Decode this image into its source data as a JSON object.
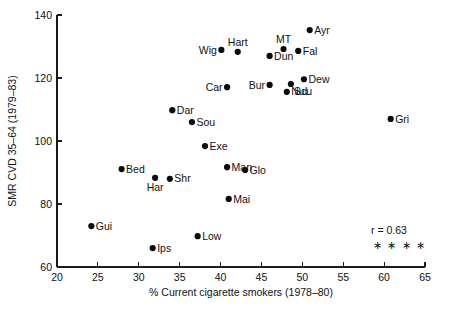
{
  "chart_data": {
    "type": "scatter",
    "title": "",
    "xlabel": "% Current cigarette smokers (1978–80)",
    "ylabel": "SMR CVD 35–64 (1979–83)",
    "xlim": [
      20,
      65
    ],
    "ylim": [
      60,
      140
    ],
    "xticks": [
      20,
      25,
      30,
      35,
      40,
      45,
      50,
      55,
      60,
      65
    ],
    "yticks": [
      60,
      80,
      100,
      120,
      140
    ],
    "xtick_labels": [
      "20",
      "25",
      "30",
      "35",
      "40",
      "45",
      "50",
      "55",
      "60",
      "65"
    ],
    "ytick_labels": [
      "60",
      "80",
      "100",
      "120",
      "140"
    ],
    "grid": false,
    "legend": "none",
    "points": [
      {
        "label": "Ayr",
        "x": 50.9,
        "y": 135.2,
        "label_pos": "right"
      },
      {
        "label": "Wig",
        "x": 40.1,
        "y": 128.9,
        "label_pos": "left"
      },
      {
        "label": "Hart",
        "x": 42.1,
        "y": 128.3,
        "label_pos": "above"
      },
      {
        "label": "MT",
        "x": 47.7,
        "y": 129.2,
        "label_pos": "above"
      },
      {
        "label": "Fal",
        "x": 49.5,
        "y": 128.6,
        "label_pos": "right"
      },
      {
        "label": "Dun",
        "x": 46.0,
        "y": 127.0,
        "label_pos": "right"
      },
      {
        "label": "Dew",
        "x": 50.2,
        "y": 119.6,
        "label_pos": "right"
      },
      {
        "label": "Scu",
        "x": 48.6,
        "y": 118.1,
        "label_pos": "below-right"
      },
      {
        "label": "Bur",
        "x": 46.0,
        "y": 117.8,
        "label_pos": "left"
      },
      {
        "label": "Car",
        "x": 40.8,
        "y": 117.1,
        "label_pos": "left"
      },
      {
        "label": "NuL",
        "x": 48.1,
        "y": 115.6,
        "label_pos": "right"
      },
      {
        "label": "Gri",
        "x": 60.8,
        "y": 107.0,
        "label_pos": "right"
      },
      {
        "label": "Dar",
        "x": 34.1,
        "y": 109.8,
        "label_pos": "right"
      },
      {
        "label": "Sou",
        "x": 36.5,
        "y": 106.0,
        "label_pos": "right"
      },
      {
        "label": "Exe",
        "x": 38.1,
        "y": 98.4,
        "label_pos": "right"
      },
      {
        "label": "Bed",
        "x": 27.9,
        "y": 91.1,
        "label_pos": "right"
      },
      {
        "label": "Man",
        "x": 40.8,
        "y": 91.7,
        "label_pos": "right"
      },
      {
        "label": "Glo",
        "x": 43.0,
        "y": 90.8,
        "label_pos": "right"
      },
      {
        "label": "Har",
        "x": 32.0,
        "y": 88.3,
        "label_pos": "below"
      },
      {
        "label": "Shr",
        "x": 33.8,
        "y": 88.0,
        "label_pos": "right"
      },
      {
        "label": "Mai",
        "x": 41.0,
        "y": 81.6,
        "label_pos": "right"
      },
      {
        "label": "Gui",
        "x": 24.2,
        "y": 73.0,
        "label_pos": "right"
      },
      {
        "label": "Low",
        "x": 37.2,
        "y": 69.8,
        "label_pos": "right"
      },
      {
        "label": "Ips",
        "x": 31.7,
        "y": 66.0,
        "label_pos": "right"
      }
    ],
    "annotations": {
      "correlation": "r = 0.63",
      "significance": "∗ ∗ ∗ ∗"
    }
  }
}
